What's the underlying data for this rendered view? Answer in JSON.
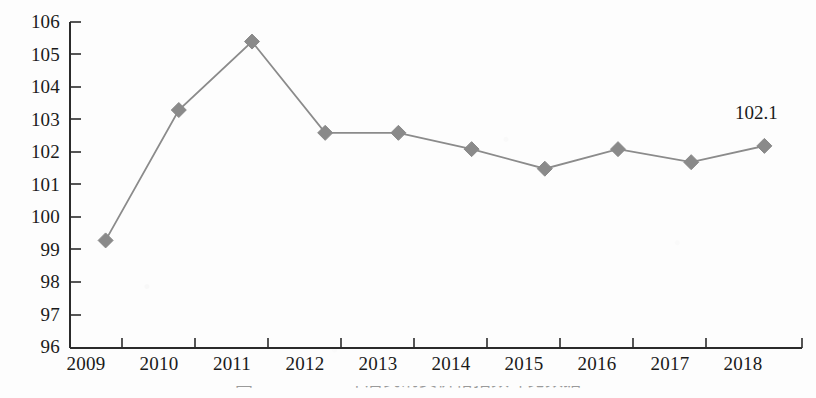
{
  "figure": {
    "caption": "图  2009—2018年居民消费价格指数环比数据",
    "caption_visible_note": "cut off at bottom edge"
  },
  "chart_data": {
    "type": "line",
    "title": "",
    "xlabel": "",
    "ylabel": "",
    "categories": [
      "2009",
      "2010",
      "2011",
      "2012",
      "2013",
      "2014",
      "2015",
      "2016",
      "2017",
      "2018"
    ],
    "values": [
      99.3,
      103.3,
      105.4,
      102.6,
      102.6,
      102.1,
      101.5,
      102.1,
      101.7,
      102.2
    ],
    "series": [
      {
        "name": "指数",
        "values": [
          99.3,
          103.3,
          105.4,
          102.6,
          102.6,
          102.1,
          101.5,
          102.1,
          101.7,
          102.2
        ]
      }
    ],
    "ylim": [
      96,
      106
    ],
    "yticks": [
      96,
      97,
      98,
      99,
      100,
      101,
      102,
      103,
      104,
      105,
      106
    ],
    "ytick_labels": [
      "96",
      "97",
      "98",
      "99",
      "100",
      "101",
      "102",
      "103",
      "104",
      "105",
      "106"
    ],
    "grid": false,
    "legend": false,
    "marker": "diamond",
    "annotations": [
      {
        "text": "102.1",
        "category": "2018",
        "value": 102.2
      }
    ],
    "colors": {
      "line": "#8b8b8b",
      "marker": "#8a8a8a",
      "axis": "#2b2b2b",
      "text": "#1a1a1a",
      "background": "#fdfdfd"
    }
  }
}
